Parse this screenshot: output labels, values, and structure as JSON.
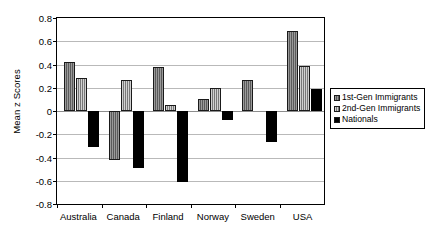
{
  "chart_data": {
    "type": "bar",
    "title": "",
    "xlabel": "",
    "ylabel": "Mean z Scores",
    "ylim": [
      -0.8,
      0.8
    ],
    "yticks": [
      "0.8",
      "0.6",
      "0.4",
      "0.2",
      "0",
      "-0.2",
      "-0.4",
      "-0.6",
      "-0.8"
    ],
    "ytick_values": [
      0.8,
      0.6,
      0.4,
      0.2,
      0,
      -0.2,
      -0.4,
      -0.6,
      -0.8
    ],
    "grid": true,
    "legend_position": "right",
    "categories": [
      "Australia",
      "Canada",
      "Finland",
      "Norway",
      "Sweden",
      "USA"
    ],
    "series": [
      {
        "name": "1st-Gen Immigrants",
        "color": "#6e6e6e",
        "values": [
          0.42,
          -0.42,
          0.38,
          0.1,
          0.27,
          0.69
        ]
      },
      {
        "name": "2nd-Gen Immigrants",
        "color": "#9a9a9a",
        "values": [
          0.28,
          0.27,
          0.05,
          0.2,
          0.0,
          0.39
        ]
      },
      {
        "name": "Nationals",
        "color": "#000000",
        "values": [
          -0.31,
          -0.49,
          -0.61,
          -0.08,
          -0.27,
          0.19
        ]
      }
    ]
  }
}
